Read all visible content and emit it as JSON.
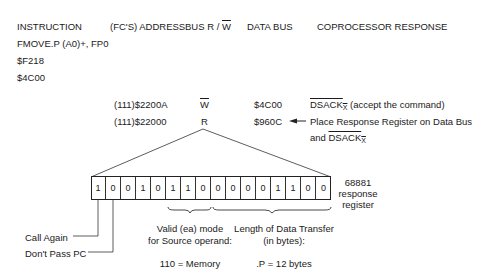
{
  "header": {
    "instruction": "INSTRUCTION",
    "address": "(FC'S) ADDRESS",
    "bus_rw": "BUS R /",
    "bus_rw_bar": "W",
    "data_bus": "DATA BUS",
    "response": "COPROCESSOR RESPONSE"
  },
  "instruction_lines": [
    "FMOVE.P (A0)+, FP0",
    "$F218",
    "$4C00"
  ],
  "cycles": [
    {
      "address": "(111)$2200A",
      "rw": "W",
      "rw_overbar": true,
      "data": "$4C00",
      "response_prefix": "DSACK",
      "response_sub": "X",
      "response_rest": " (accept the command)"
    },
    {
      "address": "(111)$22000",
      "rw": "R",
      "rw_overbar": false,
      "data": "$960C",
      "response_line1": "Place Response Register on Data Bus",
      "response_line2_prefix": "and ",
      "response_line2_dsack": "DSACK",
      "response_line2_sub": "X"
    }
  ],
  "register": {
    "bits": [
      "1",
      "0",
      "0",
      "1",
      "0",
      "1",
      "1",
      "0",
      "0",
      "0",
      "0",
      "0",
      "1",
      "1",
      "0",
      "0"
    ],
    "label_line1": "68881",
    "label_line2": "response",
    "label_line3": "register"
  },
  "annotations": {
    "call_again": "Call Again",
    "dont_pass_pc": "Don't Pass PC",
    "ea_line1": "Valid (ea) mode",
    "ea_line2": "for Source operand:",
    "ea_value": "110 = Memory",
    "len_line1": "Length of Data Transfer",
    "len_line2": "(in bytes):",
    "len_value": ".P = 12 bytes"
  }
}
